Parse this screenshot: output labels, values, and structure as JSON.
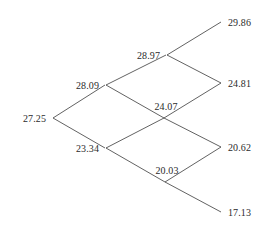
{
  "diagram": {
    "type": "binomial-lattice",
    "title": "",
    "steps": 3,
    "line_color": "#3a3a3a",
    "text_color": "#2b2b2b",
    "background_color": "#ffffff",
    "nodes": [
      {
        "id": "n0",
        "label": "27.25",
        "x": 52,
        "y": 118,
        "step": 0,
        "up_moves": 0,
        "anchor": "left"
      },
      {
        "id": "n1u",
        "label": "28.09",
        "x": 105,
        "y": 85,
        "step": 1,
        "up_moves": 1,
        "anchor": "left"
      },
      {
        "id": "n1d",
        "label": "23.34",
        "x": 105,
        "y": 148,
        "step": 1,
        "up_moves": 0,
        "anchor": "left"
      },
      {
        "id": "n2uu",
        "label": "28.97",
        "x": 166,
        "y": 55,
        "step": 2,
        "up_moves": 2,
        "anchor": "left"
      },
      {
        "id": "n2ud",
        "label": "24.07",
        "x": 164,
        "y": 118,
        "step": 2,
        "up_moves": 1,
        "anchor": "above"
      },
      {
        "id": "n2dd",
        "label": "20.03",
        "x": 165,
        "y": 182,
        "step": 2,
        "up_moves": 0,
        "anchor": "above"
      },
      {
        "id": "n3uuu",
        "label": "29.86",
        "x": 222,
        "y": 22,
        "step": 3,
        "up_moves": 3,
        "anchor": "right"
      },
      {
        "id": "n3uud",
        "label": "24.81",
        "x": 222,
        "y": 83,
        "step": 3,
        "up_moves": 2,
        "anchor": "right"
      },
      {
        "id": "n3udd",
        "label": "20.62",
        "x": 222,
        "y": 147,
        "step": 3,
        "up_moves": 1,
        "anchor": "right"
      },
      {
        "id": "n3ddd",
        "label": "17.13",
        "x": 222,
        "y": 212,
        "step": 3,
        "up_moves": 0,
        "anchor": "right"
      }
    ],
    "edges": [
      {
        "from": "n0",
        "to": "n1u",
        "direction": "up"
      },
      {
        "from": "n0",
        "to": "n1d",
        "direction": "down"
      },
      {
        "from": "n1u",
        "to": "n2uu",
        "direction": "up"
      },
      {
        "from": "n1u",
        "to": "n2ud",
        "direction": "down"
      },
      {
        "from": "n1d",
        "to": "n2ud",
        "direction": "up"
      },
      {
        "from": "n1d",
        "to": "n2dd",
        "direction": "down"
      },
      {
        "from": "n2uu",
        "to": "n3uuu",
        "direction": "up"
      },
      {
        "from": "n2uu",
        "to": "n3uud",
        "direction": "down"
      },
      {
        "from": "n2ud",
        "to": "n3uud",
        "direction": "up"
      },
      {
        "from": "n2ud",
        "to": "n3udd",
        "direction": "down"
      },
      {
        "from": "n2dd",
        "to": "n3udd",
        "direction": "up"
      },
      {
        "from": "n2dd",
        "to": "n3ddd",
        "direction": "down"
      }
    ]
  }
}
